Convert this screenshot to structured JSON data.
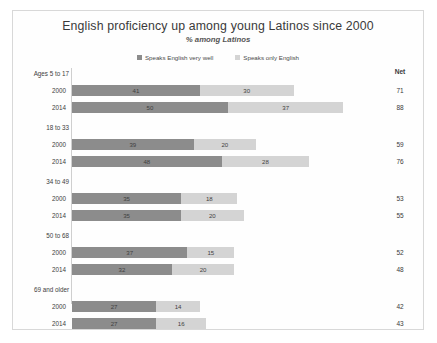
{
  "chart_data": {
    "type": "bar",
    "subtype": "stacked-horizontal",
    "title": "English proficiency up among young Latinos since 2000",
    "subtitle": "% among Latinos",
    "xlabel": "",
    "ylabel": "",
    "grid": false,
    "legend_position": "top-center",
    "net_header": "Net",
    "xlim": [
      0,
      100
    ],
    "series": [
      {
        "name": "Speaks English very well",
        "color": "#8c8c8c"
      },
      {
        "name": "Speaks only English",
        "color": "#d4d4d4"
      }
    ],
    "groups": [
      {
        "label": "Ages 5 to 17",
        "rows": [
          {
            "year": "2000",
            "values": [
              41,
              30
            ],
            "net": 71
          },
          {
            "year": "2014",
            "values": [
              50,
              37
            ],
            "net": 88
          }
        ]
      },
      {
        "label": "18 to 33",
        "rows": [
          {
            "year": "2000",
            "values": [
              39,
              20
            ],
            "net": 59
          },
          {
            "year": "2014",
            "values": [
              48,
              28
            ],
            "net": 76
          }
        ]
      },
      {
        "label": "34 to 49",
        "rows": [
          {
            "year": "2000",
            "values": [
              35,
              18
            ],
            "net": 53
          },
          {
            "year": "2014",
            "values": [
              35,
              20
            ],
            "net": 55
          }
        ]
      },
      {
        "label": "50 to 68",
        "rows": [
          {
            "year": "2000",
            "values": [
              37,
              15
            ],
            "net": 52
          },
          {
            "year": "2014",
            "values": [
              32,
              20
            ],
            "net": 48
          }
        ]
      },
      {
        "label": "69 and older",
        "rows": [
          {
            "year": "2000",
            "values": [
              27,
              14
            ],
            "net": 42
          },
          {
            "year": "2014",
            "values": [
              27,
              16
            ],
            "net": 43
          }
        ]
      }
    ]
  }
}
